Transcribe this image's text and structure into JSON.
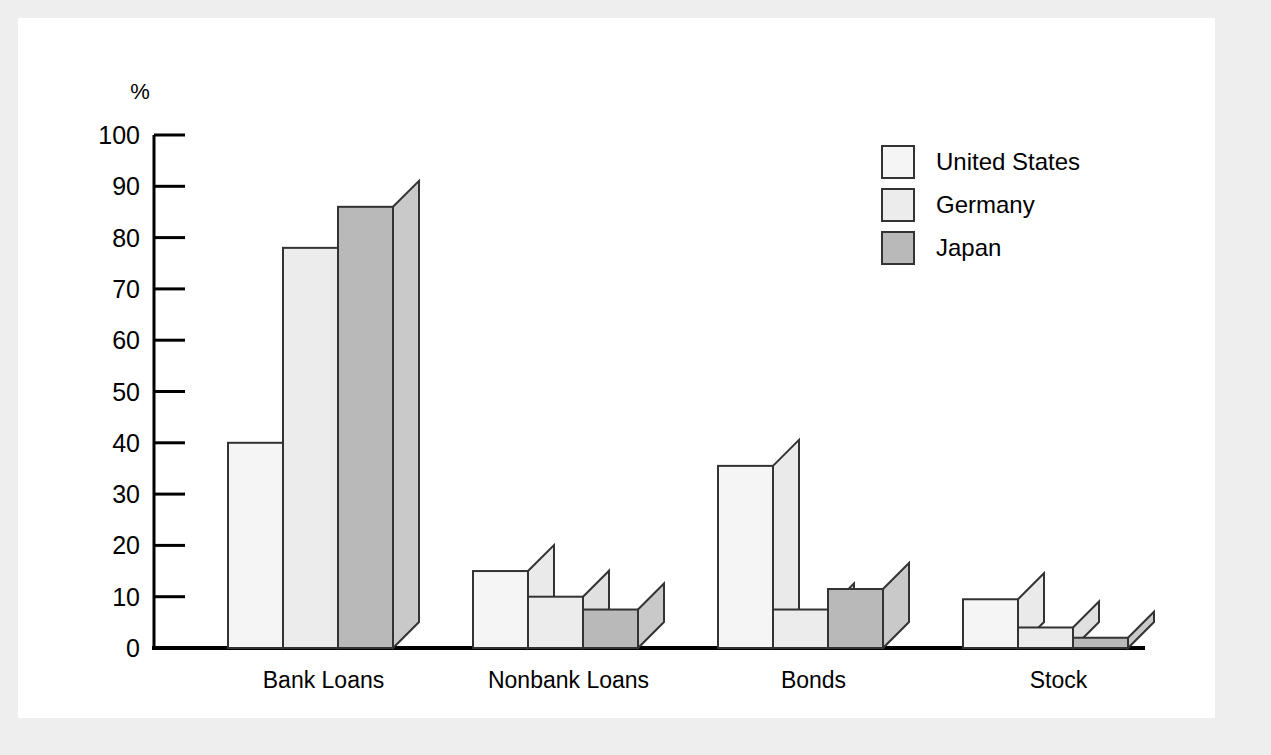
{
  "figure": {
    "background_color": "#eeeeee",
    "panel_color": "#ffffff"
  },
  "chart_data": {
    "type": "bar",
    "title": "",
    "subtitle": "",
    "xlabel": "",
    "ylabel": "%",
    "ylim": [
      0,
      100
    ],
    "ytick_step": 10,
    "ytick_labels": [
      "0",
      "10",
      "20",
      "30",
      "40",
      "50",
      "60",
      "70",
      "80",
      "90",
      "100"
    ],
    "ytick_values": [
      0,
      10,
      20,
      30,
      40,
      50,
      60,
      70,
      80,
      90,
      100
    ],
    "grid": false,
    "legend_position": "top-right",
    "bar_style": "3d-isometric",
    "categories": [
      "Bank Loans",
      "Nonbank Loans",
      "Bonds",
      "Stock"
    ],
    "series": [
      {
        "name": "United States",
        "color": "#f5f5f5",
        "side_color": "#eaeaea",
        "values": [
          40.0,
          15.0,
          35.5,
          9.5
        ]
      },
      {
        "name": "Germany",
        "color": "#ececec",
        "side_color": "#e0e0e0",
        "values": [
          78.0,
          10.0,
          7.5,
          4.0
        ]
      },
      {
        "name": "Japan",
        "color": "#b9b9b9",
        "side_color": "#c9c9c9",
        "values": [
          86.0,
          7.5,
          11.5,
          2.0
        ]
      }
    ]
  },
  "legend": {
    "items": [
      {
        "label": "United States",
        "color": "#f5f5f5"
      },
      {
        "label": "Germany",
        "color": "#ececec"
      },
      {
        "label": "Japan",
        "color": "#b9b9b9"
      }
    ]
  },
  "axis": {
    "unit_label": "%",
    "line_color": "#000000"
  }
}
